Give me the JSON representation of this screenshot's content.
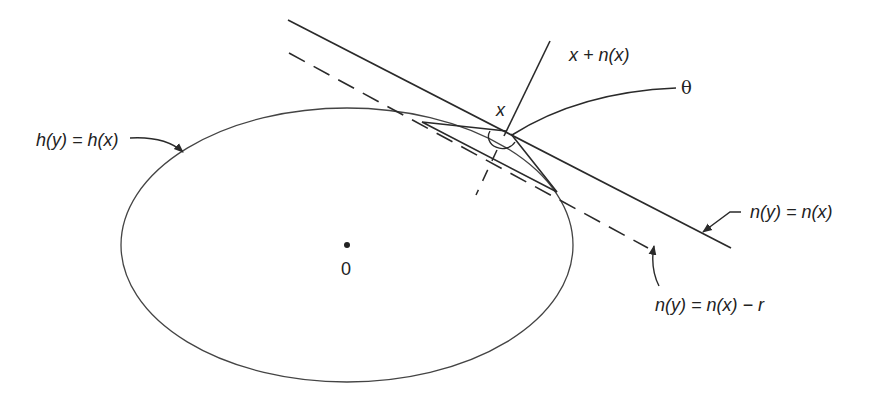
{
  "diagram": {
    "type": "geometric-figure",
    "labels": {
      "level_set": "h(y) = h(x)",
      "normal_point": "x + n(x)",
      "angle": "θ",
      "point_x": "x",
      "origin": "0",
      "tangent_plane": "n(y) = n(x)",
      "shifted_plane": "n(y) = n(x) − r"
    },
    "colors": {
      "stroke": "#2a2a2a",
      "background": "#ffffff"
    },
    "elements": [
      {
        "name": "ellipse",
        "description": "level set h(y)=h(x)",
        "center": [
          347,
          245
        ],
        "rx": 226,
        "ry": 137
      },
      {
        "name": "tangent-line",
        "style": "solid",
        "from": [
          288,
          20
        ],
        "to": [
          731,
          248
        ]
      },
      {
        "name": "shifted-line",
        "style": "dashed",
        "from": [
          289,
          53
        ],
        "to": [
          648,
          248
        ]
      },
      {
        "name": "normal-line",
        "style": "solid",
        "from": [
          506,
          132
        ],
        "to": [
          550,
          41
        ]
      },
      {
        "name": "cone-triangle",
        "points": [
          [
            422,
            122
          ],
          [
            506,
            130
          ],
          [
            557,
            192
          ]
        ]
      },
      {
        "name": "origin-point",
        "at": [
          347,
          245
        ]
      }
    ]
  }
}
